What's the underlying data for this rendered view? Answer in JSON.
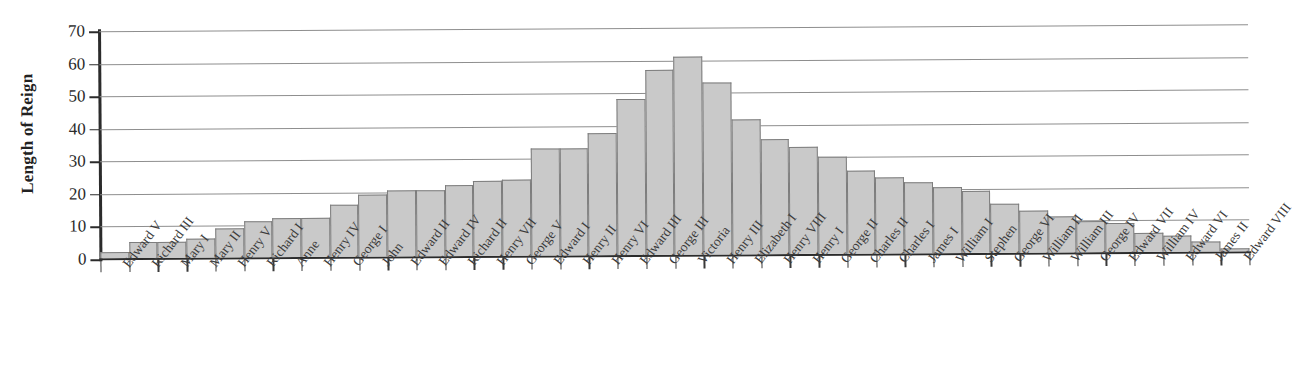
{
  "chart_data": {
    "type": "bar",
    "title": "",
    "subtitle": "",
    "xlabel": "",
    "ylabel": "Length of Reign",
    "ylim": [
      0,
      70
    ],
    "yticks": [
      0,
      10,
      20,
      30,
      40,
      50,
      60,
      70
    ],
    "grid": true,
    "legend": null,
    "bar_fill_color": "#c9c9c9",
    "bar_edge_color": "#7d7d7d",
    "axis_color": "#2b2b2b",
    "gridline_color": "#8e8e8e",
    "categories": [
      "Edward V",
      "Richard III",
      "Mary I",
      "Mary II",
      "Henry V",
      "Richard I",
      "Anne",
      "Henry IV",
      "George I",
      "John",
      "Edward II",
      "Edward IV",
      "Richard II",
      "Henry VII",
      "George V",
      "Edward I",
      "Henry II",
      "Henry VI",
      "Edward III",
      "George III",
      "Victoria",
      "Henry III",
      "Elizabeth I",
      "Henry VIII",
      "Henry I",
      "George II",
      "Charles II",
      "Charles I",
      "James I",
      "William I",
      "Stephen",
      "George VI",
      "William II",
      "William III",
      "George IV",
      "Edward VII",
      "William IV",
      "Edward VI",
      "James II",
      "Edward VIII"
    ],
    "values": [
      2,
      5,
      5,
      6,
      9,
      11,
      12,
      12,
      16,
      19,
      20.5,
      20.5,
      22,
      23,
      23.5,
      33,
      33,
      37.5,
      48,
      57,
      61,
      53,
      41.5,
      35.5,
      33,
      30,
      25.5,
      23.5,
      22,
      20.5,
      19,
      15,
      13,
      11,
      9.5,
      9,
      6,
      5,
      3,
      0.8
    ]
  }
}
